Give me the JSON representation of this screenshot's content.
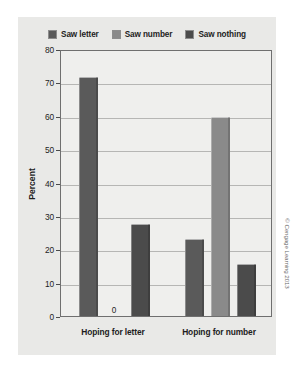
{
  "figure": {
    "credit": "© Cengage Learning 2013",
    "panel_color": "#e9e9e7",
    "plot_color": "#efefed"
  },
  "legend": {
    "position": "top",
    "items": [
      {
        "label": "Saw letter",
        "color": "#5a5a5a",
        "icon": "legend-swatch-icon"
      },
      {
        "label": "Saw number",
        "color": "#8a8a8a",
        "icon": "legend-swatch-icon"
      },
      {
        "label": "Saw nothing",
        "color": "#4b4b4b",
        "icon": "legend-swatch-icon"
      }
    ]
  },
  "chart_data": {
    "type": "bar",
    "title": "",
    "xlabel": "",
    "ylabel": "Percent",
    "ylim": [
      0,
      80
    ],
    "yticks": [
      0,
      10,
      20,
      30,
      40,
      50,
      60,
      70,
      80
    ],
    "ytick_labels": [
      "0",
      "10",
      "20",
      "30",
      "40",
      "50",
      "60",
      "70",
      "80"
    ],
    "grid": true,
    "legend_position": "top",
    "categories": [
      "Hoping for letter",
      "Hoping for number"
    ],
    "series": [
      {
        "name": "Saw letter",
        "color": "#5a5a5a",
        "values": [
          71.5,
          23.0
        ]
      },
      {
        "name": "Saw number",
        "color": "#8a8a8a",
        "values": [
          0,
          59.5
        ]
      },
      {
        "name": "Saw nothing",
        "color": "#4b4b4b",
        "values": [
          27.5,
          15.5
        ]
      }
    ],
    "data_labels": [
      {
        "series": "Saw number",
        "category": "Hoping for letter",
        "text": "0"
      }
    ]
  }
}
